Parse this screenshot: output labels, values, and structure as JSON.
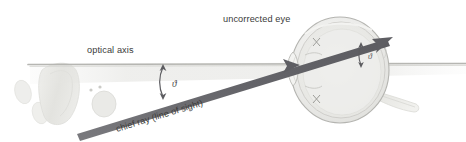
{
  "figure": {
    "background_color": "#ffffff",
    "width": 466,
    "height": 142
  },
  "labels": {
    "optical_axis": "optical axis",
    "uncorrected_eye": "uncorrected eye",
    "chief_ray": "chief ray (line of sight)",
    "angle_left": "ϑ",
    "angle_right": "ϑ"
  },
  "colors": {
    "ray": "#6f6f72",
    "ray_dark": "#5a5a5f",
    "axis_line": "#bfbfbf",
    "axis_band": "#d8d8d6",
    "eye_outline": "#b9b9b5",
    "eye_fill": "#ededea",
    "eye_inner": "#e2e2de",
    "text": "#3a3a3a",
    "ghost": "#e6e6e3",
    "ghost_mid": "#dcdcd8",
    "angle_arrow": "#55555a"
  },
  "geometry": {
    "optical_axis_y": 64,
    "optical_axis_x_start": 28,
    "optical_axis_x_end": 466,
    "chief_ray_start": [
      78,
      132
    ],
    "chief_ray_cornea": [
      296,
      66
    ],
    "chief_ray_end": [
      391,
      41
    ],
    "eye_center": [
      340,
      70
    ],
    "eye_radius_x": 48,
    "eye_radius_y": 52,
    "angle_left_marker_x": 164,
    "angle_right_marker_x": 372
  }
}
